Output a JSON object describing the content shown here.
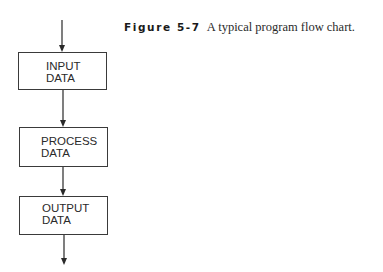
{
  "caption": {
    "figure_label": "Figure 5-7",
    "text": "A typical program flow chart."
  },
  "flowchart": {
    "nodes": [
      {
        "id": "input",
        "line1": "INPUT",
        "line2": "DATA"
      },
      {
        "id": "process",
        "line1": "PROCESS",
        "line2": "DATA"
      },
      {
        "id": "output",
        "line1": "OUTPUT",
        "line2": "DATA"
      }
    ],
    "edges": [
      {
        "from": "start",
        "to": "input"
      },
      {
        "from": "input",
        "to": "process"
      },
      {
        "from": "process",
        "to": "output"
      },
      {
        "from": "output",
        "to": "end"
      }
    ]
  },
  "colors": {
    "line": "#3a3a3a",
    "text": "#2a2a2a",
    "background": "#ffffff"
  }
}
